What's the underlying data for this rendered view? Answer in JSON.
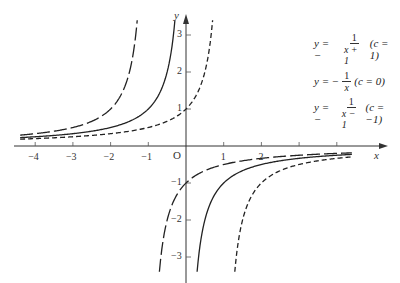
{
  "chart_data": {
    "type": "line",
    "title": "",
    "xlabel": "x",
    "ylabel": "y",
    "origin_label": "O",
    "xlim": [
      -4.5,
      4.6
    ],
    "ylim": [
      -3.5,
      3.5
    ],
    "grid": false,
    "legend_position": "upper right",
    "x_ticks": [
      -4,
      -3,
      -2,
      -1,
      1,
      2,
      3,
      4
    ],
    "x_tick_labels": [
      "-4",
      "-3",
      "-2",
      "-1",
      "",
      "1",
      "2",
      ""
    ],
    "x_tick_labels_shown": {
      "-4": "−4",
      "-3": "−3",
      "-2": "−2",
      "-1": "−1",
      "1": "1",
      "2": "2"
    },
    "y_ticks": [
      -3,
      -2,
      -1,
      1,
      2,
      3
    ],
    "y_tick_labels": [
      "−3",
      "−2",
      "−1",
      "1",
      "2",
      "3"
    ],
    "series": [
      {
        "name": "y = −1/(x+1) (c = 1)",
        "c": 1,
        "formula": "y = -1/(x+c)",
        "style": "long-dash",
        "asymptote_x": -1,
        "sample_points": [
          [
            -4.4,
            0.29
          ],
          [
            -3,
            0.5
          ],
          [
            -2,
            1
          ],
          [
            -1.5,
            2
          ],
          [
            -1.3,
            3.3
          ],
          [
            -0.7,
            -3.3
          ],
          [
            -0.5,
            -2
          ],
          [
            0,
            -1
          ],
          [
            1,
            -0.5
          ],
          [
            2,
            -0.33
          ],
          [
            4.4,
            -0.19
          ]
        ]
      },
      {
        "name": "y = −1/x (c = 0)",
        "c": 0,
        "formula": "y = -1/x",
        "style": "solid",
        "asymptote_x": 0,
        "sample_points": [
          [
            -4.4,
            0.23
          ],
          [
            -3,
            0.33
          ],
          [
            -2,
            0.5
          ],
          [
            -1,
            1
          ],
          [
            -0.5,
            2
          ],
          [
            -0.3,
            3.3
          ],
          [
            0.3,
            -3.3
          ],
          [
            0.5,
            -2
          ],
          [
            1,
            -1
          ],
          [
            2,
            -0.5
          ],
          [
            4.4,
            -0.23
          ]
        ]
      },
      {
        "name": "y = −1/(x−1) (c = −1)",
        "c": -1,
        "formula": "y = -1/(x-1)",
        "style": "short-dash",
        "asymptote_x": 1,
        "sample_points": [
          [
            -4.4,
            0.19
          ],
          [
            -2,
            0.33
          ],
          [
            -1,
            0.5
          ],
          [
            0,
            1
          ],
          [
            0.5,
            2
          ],
          [
            0.7,
            3.3
          ],
          [
            1.3,
            -3.3
          ],
          [
            1.5,
            -2
          ],
          [
            2,
            -1
          ],
          [
            3,
            -0.5
          ],
          [
            4.4,
            -0.29
          ]
        ]
      }
    ]
  },
  "legend": [
    {
      "prefix": "y = −",
      "num": "1",
      "den": "x + 1",
      "suffix": "(c = 1)"
    },
    {
      "prefix": "y = −",
      "num": "1",
      "den": "x",
      "suffix": "(c = 0)"
    },
    {
      "prefix": "y = −",
      "num": "1",
      "den": "x − 1",
      "suffix": "(c = −1)"
    }
  ],
  "axes": {
    "x_label": "x",
    "y_label": "y",
    "origin": "O"
  }
}
